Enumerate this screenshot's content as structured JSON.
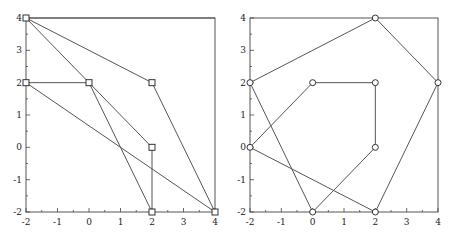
{
  "chart_data": [
    {
      "type": "line",
      "title": "",
      "xlabel": "",
      "ylabel": "",
      "xlim": [
        -2,
        4
      ],
      "ylim": [
        -2,
        4
      ],
      "grid": false,
      "marker": "square",
      "x_ticks": [
        "-2",
        "-1",
        "0",
        "1",
        "2",
        "3",
        "4"
      ],
      "y_ticks": [
        "-2",
        "-1",
        "0",
        "1",
        "2",
        "3",
        "4"
      ],
      "points": [
        [
          -2,
          4
        ],
        [
          0,
          2
        ],
        [
          2,
          2
        ],
        [
          -2,
          2
        ],
        [
          2,
          0
        ],
        [
          2,
          -2
        ],
        [
          4,
          -2
        ]
      ],
      "segments": [
        [
          [
            -2,
            4
          ],
          [
            4,
            4
          ]
        ],
        [
          [
            -2,
            4
          ],
          [
            2,
            2
          ]
        ],
        [
          [
            2,
            2
          ],
          [
            4,
            -2
          ]
        ],
        [
          [
            -2,
            4
          ],
          [
            2,
            0
          ]
        ],
        [
          [
            -2,
            2
          ],
          [
            0,
            2
          ]
        ],
        [
          [
            0,
            2
          ],
          [
            2,
            -2
          ]
        ],
        [
          [
            -2,
            2
          ],
          [
            4,
            -2
          ]
        ],
        [
          [
            2,
            0
          ],
          [
            2,
            -2
          ]
        ]
      ]
    },
    {
      "type": "line",
      "title": "",
      "xlabel": "",
      "ylabel": "",
      "xlim": [
        -2,
        4
      ],
      "ylim": [
        -2,
        4
      ],
      "grid": false,
      "marker": "circle",
      "x_ticks": [
        "-2",
        "-1",
        "0",
        "1",
        "2",
        "3",
        "4"
      ],
      "y_ticks": [
        "-2",
        "-1",
        "0",
        "1",
        "2",
        "3",
        "4"
      ],
      "points": [
        [
          2,
          4
        ],
        [
          -2,
          2
        ],
        [
          0,
          2
        ],
        [
          2,
          2
        ],
        [
          4,
          2
        ],
        [
          -2,
          0
        ],
        [
          2,
          0
        ],
        [
          0,
          -2
        ],
        [
          2,
          -2
        ]
      ],
      "segments": [
        [
          [
            -2,
            2
          ],
          [
            2,
            4
          ]
        ],
        [
          [
            2,
            4
          ],
          [
            4,
            2
          ]
        ],
        [
          [
            4,
            2
          ],
          [
            2,
            -2
          ]
        ],
        [
          [
            2,
            -2
          ],
          [
            -2,
            0
          ]
        ],
        [
          [
            -2,
            0
          ],
          [
            0,
            2
          ]
        ],
        [
          [
            0,
            2
          ],
          [
            2,
            2
          ]
        ],
        [
          [
            2,
            2
          ],
          [
            2,
            0
          ]
        ],
        [
          [
            2,
            0
          ],
          [
            0,
            -2
          ]
        ],
        [
          [
            0,
            -2
          ],
          [
            -2,
            2
          ]
        ]
      ]
    }
  ]
}
